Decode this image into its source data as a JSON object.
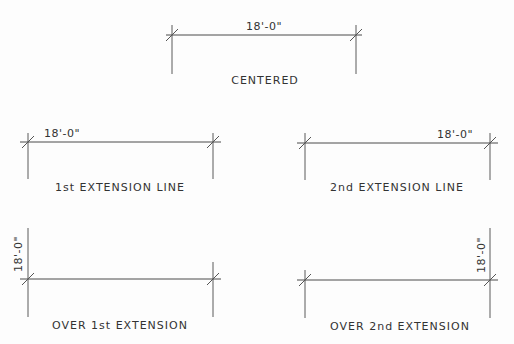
{
  "diagram": {
    "examples": [
      {
        "id": "centered",
        "dimension_text": "18'-0\"",
        "caption": "CENTERED",
        "text_position": "centered",
        "text_orientation": "horizontal"
      },
      {
        "id": "first-extension",
        "dimension_text": "18'-0\"",
        "caption": "1st EXTENSION LINE",
        "text_position": "at-first-extension",
        "text_orientation": "horizontal"
      },
      {
        "id": "second-extension",
        "dimension_text": "18'-0\"",
        "caption": "2nd EXTENSION LINE",
        "text_position": "at-second-extension",
        "text_orientation": "horizontal"
      },
      {
        "id": "over-first-extension",
        "dimension_text": "18'-0\"",
        "caption": "OVER 1st EXTENSION",
        "text_position": "over-first-extension",
        "text_orientation": "vertical"
      },
      {
        "id": "over-second-extension",
        "dimension_text": "18'-0\"",
        "caption": "OVER 2nd EXTENSION",
        "text_position": "over-second-extension",
        "text_orientation": "vertical"
      }
    ],
    "colors": {
      "line": "#4a4a4a",
      "text": "#333333",
      "background": "#fdfdfd"
    }
  }
}
